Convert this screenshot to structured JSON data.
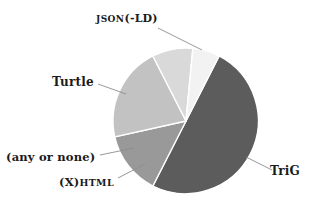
{
  "figure": {
    "background_color": "#ffffff",
    "text_color": "#1b1b1b"
  },
  "chart_data": {
    "type": "pie",
    "title": "",
    "subtitle": "",
    "xlabel": "",
    "ylabel": "",
    "legend_position": "none",
    "grid": false,
    "labels_placement": "outside-with-leader-lines",
    "center": [
      186,
      121
    ],
    "radius": 73,
    "categories": [
      "TriG",
      "JSON(-LD)",
      "Turtle",
      "(any or none)",
      "(X)HTML"
    ],
    "values": [
      50,
      14,
      21,
      9,
      6
    ],
    "unit": "percent",
    "start_angle_deg": -63,
    "direction": "clockwise",
    "slices": [
      {
        "label": "TriG",
        "value": 50,
        "color": "#5c5c5c",
        "start_angle_deg": -63,
        "end_angle_deg": 117
      },
      {
        "label": "Turtle",
        "value": 21,
        "color": "#c2c2c2",
        "start_angle_deg": 160,
        "end_angle_deg": 236
      },
      {
        "label": "JSON(-LD)",
        "value": 14,
        "color": "#999999",
        "start_angle_deg": 236,
        "end_angle_deg": 297
      },
      {
        "label": "(any or none)",
        "value": 9,
        "color": "#d9d9d9",
        "start_angle_deg": 131,
        "end_angle_deg": 160
      },
      {
        "label": "(X)HTML",
        "value": 6,
        "color": "#f2f2f2",
        "start_angle_deg": 117,
        "end_angle_deg": 131
      }
    ],
    "separator_color": "#ffffff",
    "separator_width": 1.4
  },
  "labels": {
    "json_ld": {
      "prefix": "JSON",
      "suffix": "(-LD)",
      "full": "JSON(-LD)"
    },
    "turtle": {
      "full": "Turtle"
    },
    "any_or_none": {
      "full": "(any or none)"
    },
    "xhtml": {
      "prefix": "(X)",
      "suffix": "HTML",
      "full": "(X)HTML"
    },
    "trig": {
      "full": "TriG"
    }
  },
  "leader_lines": [
    {
      "name": "json-ld-leader",
      "x1": 158,
      "y1": 28,
      "x2": 202,
      "y2": 50
    },
    {
      "name": "turtle-leader",
      "x1": 98,
      "y1": 84,
      "x2": 126,
      "y2": 94
    },
    {
      "name": "any-or-none-leader",
      "x1": 100,
      "y1": 155,
      "x2": 134,
      "y2": 148
    },
    {
      "name": "xhtml-leader",
      "x1": 118,
      "y1": 178,
      "x2": 145,
      "y2": 164
    },
    {
      "name": "trig-leader",
      "x1": 246,
      "y1": 157,
      "x2": 272,
      "y2": 170
    }
  ]
}
